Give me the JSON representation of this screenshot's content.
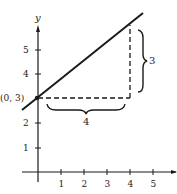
{
  "diagram": {
    "axes": {
      "y_label": "y",
      "x_ticks": [
        "1",
        "2",
        "3",
        "4",
        "5"
      ],
      "y_ticks": [
        "1",
        "2",
        "4",
        "5"
      ]
    },
    "point_label": "(0, 3)",
    "rise_label": "3",
    "run_label": "4",
    "colors": {
      "ink": "#1a1a1a",
      "background": "#ffffff"
    }
  }
}
